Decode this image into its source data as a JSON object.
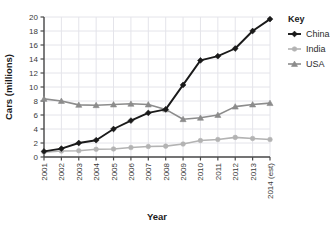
{
  "chart_data": {
    "type": "line",
    "title": "",
    "xlabel": "Year",
    "ylabel": "Cars (millions)",
    "categories": [
      "2001",
      "2002",
      "2003",
      "2004",
      "2005",
      "2006",
      "2007",
      "2008",
      "2009",
      "2010",
      "2011",
      "2012",
      "2013",
      "2014 (est)"
    ],
    "ylim": [
      0,
      20
    ],
    "yticks": [
      0,
      2,
      4,
      6,
      8,
      10,
      12,
      14,
      16,
      18,
      20
    ],
    "ytick_labels": [
      "0",
      "2",
      "4",
      "6",
      "8",
      "10",
      "12",
      "14",
      "16",
      "18",
      "20"
    ],
    "grid": true,
    "legend_position": "right",
    "legend_title": "Key",
    "series": [
      {
        "name": "China",
        "color": "#1a1a1a",
        "marker": "diamond",
        "values": [
          0.8,
          1.2,
          2.0,
          2.4,
          4.0,
          5.2,
          6.3,
          6.8,
          10.3,
          13.8,
          14.4,
          15.5,
          18.0,
          19.7
        ]
      },
      {
        "name": "India",
        "color": "#b3b3b3",
        "marker": "circle",
        "values": [
          0.7,
          0.85,
          0.9,
          1.1,
          1.15,
          1.35,
          1.5,
          1.55,
          1.85,
          2.35,
          2.5,
          2.8,
          2.65,
          2.5
        ]
      },
      {
        "name": "USA",
        "color": "#8c8c8c",
        "marker": "triangle",
        "values": [
          8.3,
          8.0,
          7.45,
          7.4,
          7.5,
          7.6,
          7.5,
          6.8,
          5.4,
          5.6,
          6.0,
          7.2,
          7.5,
          7.7
        ]
      }
    ]
  },
  "style": {
    "grid_color": "#e4e4ea",
    "axis_color": "#4a4a4a",
    "background": "#ffffff"
  },
  "geometry": {
    "plot_left": 44,
    "plot_right": 270,
    "plot_top": 17,
    "plot_bottom": 157
  }
}
